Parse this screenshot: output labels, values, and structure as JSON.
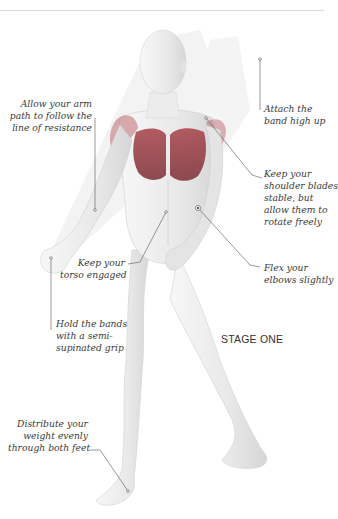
{
  "figure": {
    "title": "STAGE ONE",
    "colors": {
      "muscle": "#b5545a",
      "muscle_dark": "#8e3f45",
      "skin": "#ececec",
      "band": "#e6e6e6",
      "leader_line": "#555555",
      "text": "#3a3a3a",
      "rule": "#d9d9d9"
    }
  },
  "annotations": [
    {
      "id": "arm-path",
      "lines": [
        "Allow your arm",
        "path to follow the",
        "line of resistance"
      ]
    },
    {
      "id": "attach-band",
      "lines": [
        "Attach the",
        "band high up"
      ]
    },
    {
      "id": "shoulder-blades",
      "lines": [
        "Keep your",
        "shoulder blades",
        "stable, but",
        "allow them to",
        "rotate freely"
      ]
    },
    {
      "id": "elbows",
      "lines": [
        "Flex your",
        "elbows slightly"
      ]
    },
    {
      "id": "torso",
      "lines": [
        "Keep your",
        "torso engaged"
      ]
    },
    {
      "id": "grip",
      "lines": [
        "Hold the bands",
        "with a semi-",
        "supinated grip"
      ]
    },
    {
      "id": "feet",
      "lines": [
        "Distribute your",
        "weight evenly",
        "through both feet"
      ]
    }
  ]
}
